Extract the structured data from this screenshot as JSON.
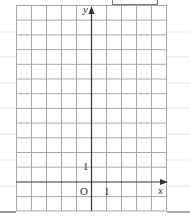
{
  "diagram": {
    "type": "coordinate-grid",
    "grid": {
      "columns": 10,
      "rows": 14,
      "x_range": [
        -5,
        5
      ],
      "y_range": [
        -2,
        12
      ],
      "line_color": "#a8a8a8",
      "axis_color": "#333333"
    },
    "axes": {
      "x_label": "x",
      "y_label": "y",
      "origin_label": "O",
      "x_unit_label": "1",
      "y_unit_label": "1"
    },
    "answer_box": {
      "visible": true
    }
  }
}
